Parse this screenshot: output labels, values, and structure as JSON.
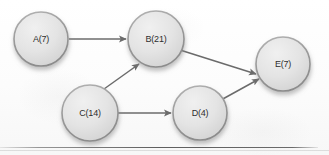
{
  "diagram": {
    "type": "directed-graph",
    "background_color": "#fdfdfd",
    "node_fill_color": "#e3e3e3",
    "node_stroke_color": "#9a9a9a",
    "node_text_color": "#2e2e2e",
    "edge_color": "#6b6b6b",
    "nodes": [
      {
        "id": "A",
        "label": "A(7)",
        "cx": 41,
        "cy": 39,
        "r": 27
      },
      {
        "id": "B",
        "label": "B(21)",
        "cx": 156,
        "cy": 39,
        "r": 28
      },
      {
        "id": "C",
        "label": "C(14)",
        "cx": 90,
        "cy": 113,
        "r": 28
      },
      {
        "id": "D",
        "label": "D(4)",
        "cx": 200,
        "cy": 113,
        "r": 27
      },
      {
        "id": "E",
        "label": "E(7)",
        "cx": 283,
        "cy": 64,
        "r": 27
      }
    ],
    "edges": [
      {
        "from": "A",
        "to": "B",
        "x1": 69,
        "y1": 39,
        "x2": 126,
        "y2": 39
      },
      {
        "from": "C",
        "to": "B",
        "x1": 104,
        "y1": 89,
        "x2": 139,
        "y2": 64
      },
      {
        "from": "C",
        "to": "D",
        "x1": 118,
        "y1": 113,
        "x2": 171,
        "y2": 113
      },
      {
        "from": "B",
        "to": "E",
        "x1": 180,
        "y1": 50,
        "x2": 256,
        "y2": 74
      },
      {
        "from": "D",
        "to": "E",
        "x1": 221,
        "y1": 100,
        "x2": 259,
        "y2": 79
      }
    ],
    "bottom_rule": {
      "y": 147,
      "color": "#3c3c3c"
    },
    "bottom_rule_soft": {
      "y": 150
    }
  }
}
